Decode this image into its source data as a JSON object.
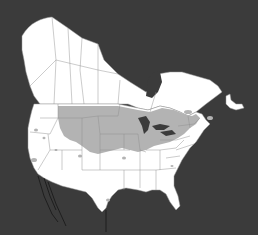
{
  "map": {
    "title": "",
    "region": "North America (Canada and United States)",
    "legend": [],
    "colors": {
      "background": "#3b3b3b",
      "land": "#ffffff",
      "range_shading": "#b3b3b3",
      "borders": "#8c8c8c"
    },
    "layers": [
      {
        "name": "landmass",
        "label": ""
      },
      {
        "name": "distribution-range",
        "label": ""
      },
      {
        "name": "state-province-borders",
        "label": ""
      }
    ]
  }
}
